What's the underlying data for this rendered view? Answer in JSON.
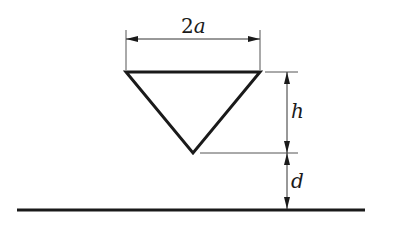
{
  "diagram": {
    "labels": {
      "width": "2a",
      "width_num": "2",
      "width_var": "a",
      "height": "h",
      "gap": "d"
    },
    "colors": {
      "stroke": "#1a1a1a",
      "dim_line": "#555555",
      "background": "#ffffff"
    },
    "geometry": {
      "triangle": {
        "top_left": [
          126,
          72
        ],
        "top_right": [
          260,
          72
        ],
        "apex": [
          193,
          153
        ]
      },
      "ground": {
        "x1": 17,
        "x2": 365,
        "y": 210
      },
      "width_dim": {
        "x1": 126,
        "x2": 260,
        "y": 39
      },
      "height_dim": {
        "x": 287,
        "y1": 72,
        "y2": 153
      },
      "gap_dim": {
        "x": 287,
        "y1": 153,
        "y2": 210
      }
    }
  }
}
